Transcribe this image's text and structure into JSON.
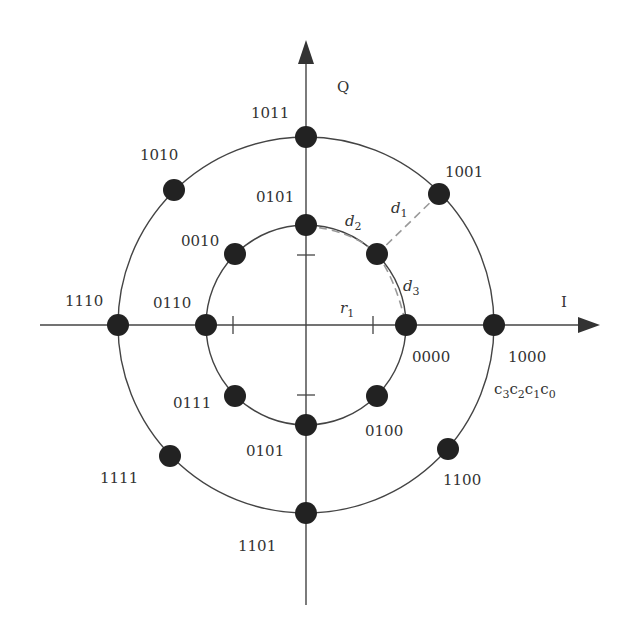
{
  "diagram": {
    "axes": {
      "horizontal_label": "I",
      "vertical_label": "Q"
    },
    "bit_order_label": {
      "base": "c",
      "subs": [
        "3",
        "2",
        "1",
        "0"
      ]
    },
    "distance_labels": {
      "r1": {
        "base": "r",
        "sub": "1"
      },
      "d1": {
        "base": "d",
        "sub": "1"
      },
      "d2": {
        "base": "d",
        "sub": "2"
      },
      "d3": {
        "base": "d",
        "sub": "3"
      }
    },
    "inner_ring": {
      "points": [
        {
          "label": "0000",
          "angle_deg": 0
        },
        {
          "label": "0001",
          "angle_deg": 45
        },
        {
          "label": "0101",
          "angle_deg": 90
        },
        {
          "label": "0010",
          "angle_deg": 135
        },
        {
          "label": "0110",
          "angle_deg": 180
        },
        {
          "label": "0111",
          "angle_deg": 225
        },
        {
          "label": "0101",
          "angle_deg": 270
        },
        {
          "label": "0100",
          "angle_deg": 315
        }
      ]
    },
    "outer_ring": {
      "points": [
        {
          "label": "1000",
          "angle_deg": 0
        },
        {
          "label": "1001",
          "angle_deg": 45
        },
        {
          "label": "1011",
          "angle_deg": 90
        },
        {
          "label": "1010",
          "angle_deg": 135
        },
        {
          "label": "1110",
          "angle_deg": 180
        },
        {
          "label": "1111",
          "angle_deg": 225
        },
        {
          "label": "1101",
          "angle_deg": 270
        },
        {
          "label": "1100",
          "angle_deg": 315
        }
      ]
    },
    "labels": {
      "p1011": "1011",
      "p1010": "1010",
      "p1001": "1001",
      "p1110": "1110",
      "p1000": "1000",
      "p1111": "1111",
      "p1100": "1100",
      "p1101": "1101",
      "p0101_top": "0101",
      "p0010": "0010",
      "p0110": "0110",
      "p0000": "0000",
      "p0111": "0111",
      "p0100": "0100",
      "p0101_bottom": "0101"
    }
  }
}
